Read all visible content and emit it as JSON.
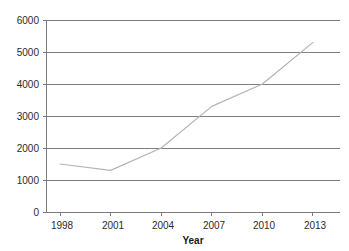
{
  "chart_data": {
    "type": "line",
    "title": "",
    "subtitle": "",
    "xlabel": "Year",
    "ylabel": "",
    "x": [
      1998,
      2001,
      2004,
      2007,
      2010,
      2013
    ],
    "categories": [
      "1998",
      "2001",
      "2004",
      "2007",
      "2010",
      "2013"
    ],
    "values": [
      1500,
      1300,
      2000,
      3300,
      4000,
      5300
    ],
    "series": [
      {
        "name": "",
        "values": [
          1500,
          1300,
          2000,
          3300,
          4000,
          5300
        ]
      }
    ],
    "ylim": [
      0,
      6000
    ],
    "xlim": [
      1997,
      2014
    ],
    "yticks": [
      0,
      1000,
      2000,
      3000,
      4000,
      5000,
      6000
    ],
    "ytick_labels": [
      "0",
      "1000",
      "2000",
      "3000",
      "4000",
      "5000",
      "6000"
    ],
    "xticks": [
      1998,
      2001,
      2004,
      2007,
      2010,
      2013
    ],
    "xtick_labels": [
      "1998",
      "2001",
      "2004",
      "2007",
      "2010",
      "2013"
    ],
    "grid": "horizontal",
    "legend": "none",
    "annotations": [],
    "colors": {
      "series_line": "#b3b3b3",
      "gridline": "#808080",
      "axis": "#7a7a7a",
      "text": "#2b2b2b",
      "background": "#ffffff"
    }
  },
  "axes": {
    "y_labels": [
      {
        "value": "6000"
      },
      {
        "value": "5000"
      },
      {
        "value": "4000"
      },
      {
        "value": "3000"
      },
      {
        "value": "2000"
      },
      {
        "value": "1000"
      },
      {
        "value": "0"
      }
    ],
    "x_labels": [
      {
        "value": "1998"
      },
      {
        "value": "2001"
      },
      {
        "value": "2004"
      },
      {
        "value": "2007"
      },
      {
        "value": "2010"
      },
      {
        "value": "2013"
      }
    ],
    "x_axis_title": "Year"
  }
}
